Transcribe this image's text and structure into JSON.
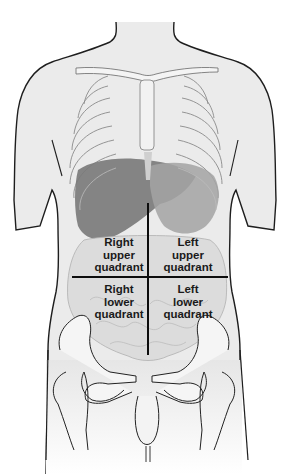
{
  "diagram": {
    "colors": {
      "background": "#ffffff",
      "body_fill": "#e9e9e9",
      "outline": "#1e1e1e",
      "bone_fill": "#f3f3f3",
      "liver": "#7a7a7a",
      "stomach": "#9c9c9c",
      "intestine": "#d2d2d2",
      "divider": "#0d0d0d"
    },
    "dividers": {
      "vertical": {
        "x": 148,
        "y1": 203,
        "y2": 355
      },
      "horizontal": {
        "y": 277,
        "x1": 72,
        "x2": 228
      }
    },
    "quadrants": [
      {
        "id": "ruq",
        "lines": [
          "Right",
          "upper",
          "quadrant"
        ]
      },
      {
        "id": "luq",
        "lines": [
          "Left",
          "upper",
          "quadrant"
        ]
      },
      {
        "id": "rlq",
        "lines": [
          "Right",
          "lower",
          "quadrant"
        ]
      },
      {
        "id": "llq",
        "lines": [
          "Left",
          "lower",
          "quadrant"
        ]
      }
    ]
  }
}
